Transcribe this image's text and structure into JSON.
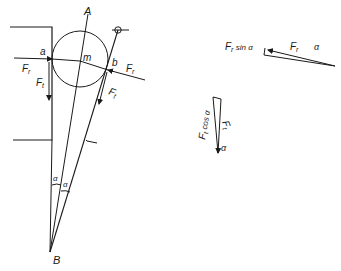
{
  "diagram": {
    "type": "force-diagram",
    "ink_color": "#1a1a1a",
    "background": "#ffffff",
    "labels": {
      "point_A": "A",
      "point_B": "B",
      "center_m": "m",
      "contact_a": "a",
      "contact_b": "b",
      "force_Fr_left": "F",
      "force_Fr_left_sub": "r",
      "force_Ft_left": "F",
      "force_Ft_left_sub": "t",
      "force_Fr_right": "F",
      "force_Fr_right_sub": "r",
      "force_Ft_right": "F",
      "force_Ft_right_sub": "t",
      "angle_alpha_1": "α",
      "angle_alpha_2": "α"
    },
    "triangle_top": {
      "Fr_sin_label": "F",
      "Fr_sin_sub": "r",
      "Fr_sin_suffix": " sin α",
      "Fr_label": "F",
      "Fr_sub": "r",
      "alpha": "α"
    },
    "triangle_bottom": {
      "Ft_cos_label": "F",
      "Ft_cos_sub": "t",
      "Ft_cos_suffix": " cos α",
      "Ft_label": "F",
      "Ft_sub": "t",
      "alpha": "α"
    }
  }
}
